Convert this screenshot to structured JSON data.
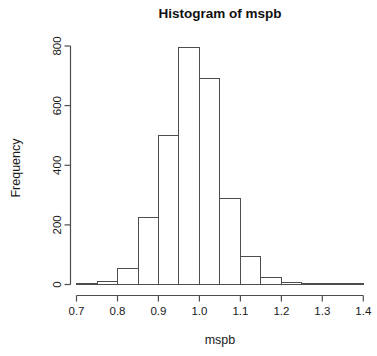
{
  "colors": {
    "background": "#ffffff",
    "bar_fill": "#ffffff",
    "bar_border": "#4d4d4d",
    "axis": "#4d4d4d",
    "text": "#1a1a1a"
  },
  "chart_data": {
    "type": "bar",
    "subtype": "histogram",
    "title": "Histogram of mspb",
    "xlabel": "mspb",
    "ylabel": "Frequency",
    "bin_edges": [
      0.7,
      0.75,
      0.8,
      0.85,
      0.9,
      0.95,
      1.0,
      1.05,
      1.1,
      1.15,
      1.2,
      1.25,
      1.3,
      1.35,
      1.4
    ],
    "values": [
      2,
      10,
      55,
      225,
      500,
      795,
      690,
      290,
      95,
      22,
      8,
      5,
      3,
      3
    ],
    "x_ticks": [
      "0.7",
      "0.8",
      "0.9",
      "1.0",
      "1.1",
      "1.2",
      "1.3",
      "1.4"
    ],
    "y_ticks": [
      0,
      200,
      400,
      600,
      800
    ],
    "xlim": [
      0.7,
      1.4
    ],
    "ylim": [
      0,
      800
    ],
    "grid": false,
    "legend": false
  }
}
